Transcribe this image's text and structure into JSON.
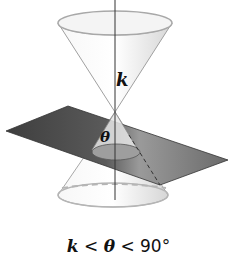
{
  "diagram": {
    "type": "conic-section",
    "labels": {
      "cone_angle": "k",
      "plane_angle": "θ"
    },
    "caption": {
      "var1": "k",
      "op1": " < ",
      "var2": "θ",
      "op2": " < ",
      "value": "90°"
    },
    "colors": {
      "plane_dark": "#4a4a4a",
      "plane_light": "#8c8c8c",
      "cone_fill": "#efefef",
      "cone_edge": "#9a9a9a",
      "axis": "#333333"
    }
  }
}
